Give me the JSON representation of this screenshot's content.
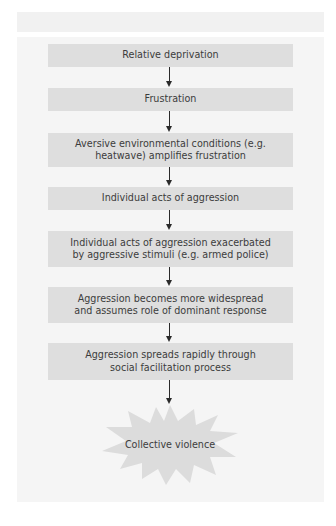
{
  "diagram": {
    "type": "flowchart",
    "direction": "top-to-bottom",
    "colors": {
      "panel_background": "#f5f5f5",
      "box_fill": "#dedede",
      "arrow": "#2a2a2a",
      "text": "#3c3c3c",
      "burst_fill": "#dcdcdc"
    },
    "steps": [
      {
        "label": "Relative deprivation"
      },
      {
        "label": "Frustration"
      },
      {
        "label": "Aversive environmental conditions (e.g. heatwave) amplifies frustration"
      },
      {
        "label": "Individual acts of aggression"
      },
      {
        "label": "Individual acts of aggression exacerbated by aggressive stimuli (e.g. armed police)"
      },
      {
        "label": "Aggression becomes more widespread and assumes role of dominant response"
      },
      {
        "label": "Aggression spreads rapidly through social facilitation process"
      }
    ],
    "outcome": {
      "label": "Collective violence",
      "shape": "explosion-burst"
    }
  }
}
